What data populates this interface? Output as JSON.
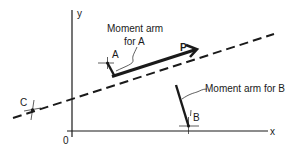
{
  "diagram": {
    "axes": {
      "y_label": "y",
      "x_label": "x",
      "origin_label": "0"
    },
    "force": {
      "label": "P"
    },
    "points": [
      {
        "id": "A",
        "label": "A"
      },
      {
        "id": "B",
        "label": "B"
      },
      {
        "id": "C",
        "label": "C"
      }
    ],
    "annotations": {
      "moment_arm_a_line1": "Moment arm",
      "moment_arm_a_line2": "for A",
      "moment_arm_b": "Moment arm for B"
    },
    "colors": {
      "ink": "#1a1a1a",
      "background": "#ffffff"
    }
  }
}
